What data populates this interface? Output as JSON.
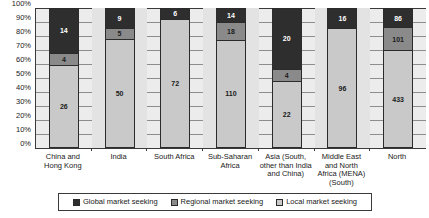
{
  "chart_data": {
    "type": "bar",
    "subtype": "100% stacked bar",
    "title": "",
    "subtitle": "",
    "xlabel": "",
    "ylabel": "",
    "ylim": [
      0,
      100
    ],
    "ytick_labels": [
      "100%",
      "90%",
      "80%",
      "70%",
      "60%",
      "50%",
      "40%",
      "30%",
      "20%",
      "10%",
      "0%"
    ],
    "ytick_values": [
      100,
      90,
      80,
      70,
      60,
      50,
      40,
      30,
      20,
      10,
      0
    ],
    "grid": true,
    "legend_position": "bottom",
    "categories": [
      "China and Hong Kong",
      "India",
      "South Africa",
      "Sub-Saharan Africa",
      "Asia (South, other than India and China)",
      "Middle East and North Africa (MENA) (South)",
      "North"
    ],
    "category_lines": [
      [
        "China and",
        "Hong Kong"
      ],
      [
        "India"
      ],
      [
        "South Africa"
      ],
      [
        "Sub-Saharan",
        "Africa"
      ],
      [
        "Asia (South,",
        "other than India",
        "and China)"
      ],
      [
        "Middle East",
        "and North",
        "Africa (MENA)",
        "(South)"
      ]
    ],
    "series": [
      {
        "name": "Global market seeking",
        "color": "#2e2e2e",
        "values": [
          14,
          9,
          6,
          14,
          20,
          16,
          86
        ]
      },
      {
        "name": "Regional market seeking",
        "color": "#8a8a8a",
        "values": [
          4,
          5,
          0,
          18,
          4,
          0,
          101
        ]
      },
      {
        "name": "Local market seeking",
        "color": "#c9c9c9",
        "values": [
          26,
          50,
          72,
          110,
          22,
          96,
          433
        ]
      }
    ],
    "stack_order_top_to_bottom": [
      "Global market seeking",
      "Regional market seeking",
      "Local market seeking"
    ],
    "totals": [
      44,
      64,
      78,
      142,
      46,
      112,
      620
    ]
  },
  "legend": {
    "items": [
      {
        "label": "Global market seeking",
        "color": "#2e2e2e"
      },
      {
        "label": "Regional market seeking",
        "color": "#8a8a8a"
      },
      {
        "label": "Local market seeking",
        "color": "#c9c9c9"
      }
    ]
  }
}
